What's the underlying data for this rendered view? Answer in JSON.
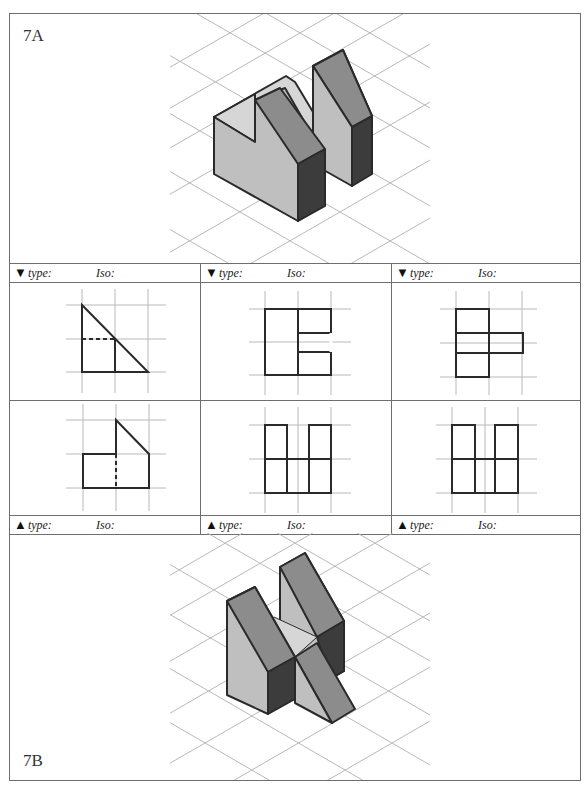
{
  "panels": {
    "top": {
      "label": "7A",
      "description": "isometric view of two-prism object with slanted roofs"
    },
    "bottom": {
      "label": "7B",
      "description": "isometric view of two slanted blocks joined by a diagonal wedge"
    }
  },
  "table": {
    "header_top": [
      {
        "marker": "▼",
        "type_label": "type:",
        "iso_label": "Iso:"
      },
      {
        "marker": "▼",
        "type_label": "type:",
        "iso_label": "Iso:"
      },
      {
        "marker": "▼",
        "type_label": "type:",
        "iso_label": "Iso:"
      }
    ],
    "header_bottom": [
      {
        "marker": "▲",
        "type_label": "type:",
        "iso_label": "Iso:"
      },
      {
        "marker": "▲",
        "type_label": "type:",
        "iso_label": "Iso:"
      },
      {
        "marker": "▲",
        "type_label": "type:",
        "iso_label": "Iso:"
      }
    ],
    "views_top_row": [
      {
        "name": "right-triangle-with-hidden-line"
      },
      {
        "name": "square-with-c-notch"
      },
      {
        "name": "t-shape-stack"
      }
    ],
    "views_bottom_row": [
      {
        "name": "pentagon-step-with-hidden-line"
      },
      {
        "name": "double-column-grid"
      },
      {
        "name": "double-column-grid"
      }
    ]
  },
  "colors": {
    "border": "#6e6e6e",
    "grid": "#b8b8b8",
    "outline": "#2a2a2a",
    "face_light": "#bfbfbf",
    "face_mid": "#8c8c8c",
    "face_dark": "#3c3c3c",
    "face_top": "#d6d6d6"
  }
}
